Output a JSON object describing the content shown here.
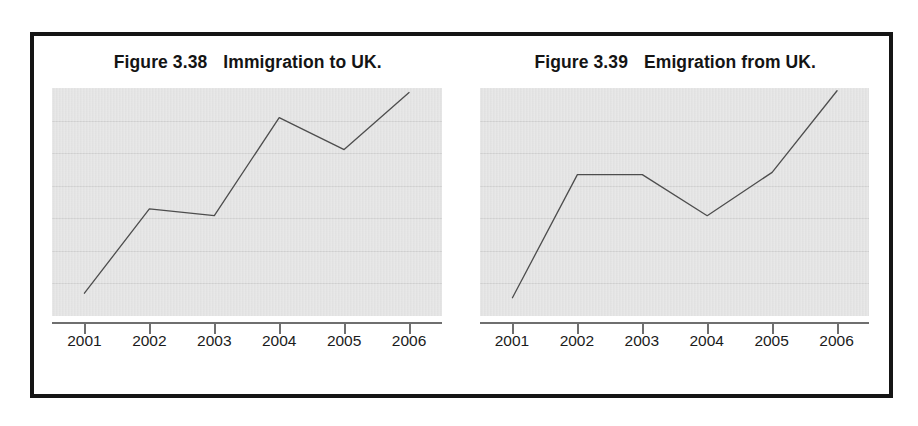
{
  "page": {
    "background_color": "#ffffff",
    "frame_color": "#151515"
  },
  "figures": [
    {
      "caption_number": "Figure 3.38",
      "caption_text": "Immigration to UK.",
      "chart_data": {
        "type": "line",
        "title": "Figure 3.38   Immigration to UK.",
        "xlabel": "",
        "ylabel": "",
        "categories": [
          "2001",
          "2002",
          "2003",
          "2004",
          "2005",
          "2006"
        ],
        "values": [
          0.1,
          0.47,
          0.44,
          0.87,
          0.73,
          0.98
        ],
        "ylim": [
          0,
          1
        ],
        "grid": true,
        "gridline_count": 6,
        "legend": "none",
        "line_color": "#4d4d4d",
        "plot_background": "#e3e3e3"
      }
    },
    {
      "caption_number": "Figure 3.39",
      "caption_text": "Emigration from UK.",
      "chart_data": {
        "type": "line",
        "title": "Figure 3.39   Emigration from UK.",
        "xlabel": "",
        "ylabel": "",
        "categories": [
          "2001",
          "2002",
          "2003",
          "2004",
          "2005",
          "2006"
        ],
        "values": [
          0.08,
          0.62,
          0.62,
          0.44,
          0.63,
          1.0
        ],
        "ylim": [
          0,
          1
        ],
        "grid": true,
        "gridline_count": 6,
        "legend": "none",
        "line_color": "#4d4d4d",
        "plot_background": "#e3e3e3"
      }
    }
  ]
}
